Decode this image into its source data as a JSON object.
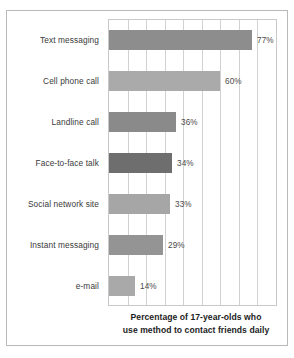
{
  "chart_data": {
    "type": "bar",
    "orientation": "horizontal",
    "title": "",
    "xlabel": "Percentage of 17-year-olds who use method to contact friends daily",
    "ylabel": "",
    "xlim": [
      0,
      90
    ],
    "grid": "vertical",
    "gridline_step": 10,
    "legend": "none",
    "categories": [
      "Text messaging",
      "Cell phone call",
      "Landline call",
      "Face-to-face talk",
      "Social network site",
      "Instant messaging",
      "e-mail"
    ],
    "values": [
      77,
      60,
      36,
      34,
      33,
      29,
      14
    ],
    "value_labels": [
      "77%",
      "60%",
      "36%",
      "34%",
      "33%",
      "29%",
      "14%"
    ],
    "bar_colors": [
      "#8d8d8d",
      "#aaaaaa",
      "#8a8a8a",
      "#6e6e6e",
      "#a6a6a6",
      "#949494",
      "#a9a9a9"
    ]
  },
  "axis_title": {
    "line1": "Percentage of 17-year-olds who",
    "line2": "use method to contact friends daily"
  },
  "style": {
    "frame_color": "#b9b9b9",
    "grid_color": "#d2d2d2",
    "label_color": "#3a3a3a",
    "value_color": "#4a4a4a",
    "background": "#ffffff"
  }
}
